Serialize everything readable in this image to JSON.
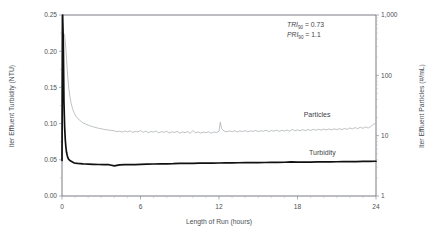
{
  "chart_data": {
    "type": "line",
    "title": "",
    "xlabel": "Length of Run  (hours)",
    "ylabel": "lter Effluent Turbidity  (NTU)",
    "y2label": "lter Effluent Particles  (#/mL)",
    "xlim": [
      0,
      24
    ],
    "ylim": [
      0.0,
      0.25
    ],
    "y2lim": [
      1,
      1000
    ],
    "y2scale": "log",
    "grid": false,
    "legend_position": "inline-annotations",
    "xticks": [
      0,
      6,
      12,
      18,
      24
    ],
    "xticklabels": [
      "0",
      "6",
      "12",
      "18",
      "24"
    ],
    "yticks": [
      0.0,
      0.05,
      0.1,
      0.15,
      0.2,
      0.25
    ],
    "yticklabels": [
      "0.00",
      "0.05",
      "0.10",
      "0.15",
      "0.20",
      "0.25"
    ],
    "y2ticks": [
      1,
      10,
      100,
      1000
    ],
    "y2ticklabels": [
      "1",
      "10",
      "100",
      "1,000"
    ],
    "annotations": [
      {
        "text_italic": "TRI",
        "subscript": "90",
        "text_rest": " = 0.73"
      },
      {
        "text_italic": "PRI",
        "subscript": "90",
        "text_rest": " = 1.1"
      }
    ],
    "series": [
      {
        "name": "Turbidity",
        "axis": "left",
        "units": "NTU",
        "color": "#111111",
        "label_x": 19.9,
        "label_y": 0.0565,
        "x": [
          0.0,
          0.05,
          0.1,
          0.15,
          0.2,
          0.25,
          0.3,
          0.35,
          0.4,
          0.45,
          0.5,
          0.6,
          0.7,
          0.8,
          0.9,
          1.0,
          1.2,
          1.4,
          1.6,
          1.8,
          2.0,
          2.4,
          2.8,
          3.2,
          3.6,
          4.0,
          4.4,
          4.8,
          5.2,
          5.6,
          6.0,
          6.5,
          7.0,
          7.5,
          8.0,
          8.5,
          9.0,
          9.5,
          10.0,
          10.5,
          11.0,
          11.5,
          12.0,
          12.5,
          13.0,
          13.5,
          14.0,
          14.5,
          15.0,
          15.5,
          16.0,
          16.5,
          17.0,
          17.5,
          18.0,
          18.5,
          19.0,
          19.5,
          20.0,
          20.5,
          21.0,
          21.5,
          22.0,
          22.5,
          23.0,
          23.5,
          24.0
        ],
        "y": [
          0.049,
          0.25,
          0.213,
          0.13,
          0.096,
          0.078,
          0.067,
          0.06,
          0.056,
          0.053,
          0.051,
          0.049,
          0.048,
          0.047,
          0.046,
          0.0455,
          0.045,
          0.0447,
          0.0444,
          0.0442,
          0.044,
          0.0437,
          0.0435,
          0.0433,
          0.0432,
          0.0415,
          0.043,
          0.0432,
          0.0433,
          0.0434,
          0.0436,
          0.044,
          0.0442,
          0.0444,
          0.0445,
          0.0447,
          0.0452,
          0.045,
          0.0452,
          0.0453,
          0.0454,
          0.0455,
          0.0456,
          0.0457,
          0.0458,
          0.0459,
          0.046,
          0.0461,
          0.0462,
          0.0463,
          0.0464,
          0.0465,
          0.0466,
          0.047,
          0.0467,
          0.0468,
          0.0469,
          0.047,
          0.0471,
          0.0472,
          0.0473,
          0.0474,
          0.0475,
          0.0476,
          0.0477,
          0.0478,
          0.048
        ]
      },
      {
        "name": "Particles",
        "axis": "right",
        "units": "#/mL",
        "color": "#a8adb2",
        "label_x": 19.5,
        "label_y_turb_equiv": 0.1085,
        "x": [
          0.0,
          0.05,
          0.1,
          0.15,
          0.2,
          0.25,
          0.3,
          0.35,
          0.4,
          0.5,
          0.6,
          0.7,
          0.8,
          0.9,
          1.0,
          1.2,
          1.4,
          1.6,
          1.8,
          2.0,
          2.2,
          2.4,
          2.6,
          2.8,
          3.0,
          3.2,
          3.4,
          3.6,
          3.8,
          4.0,
          4.2,
          4.4,
          4.6,
          4.8,
          5.0,
          5.2,
          5.4,
          5.6,
          5.8,
          6.0,
          6.2,
          6.4,
          6.6,
          6.8,
          7.0,
          7.2,
          7.4,
          7.6,
          7.8,
          8.0,
          8.2,
          8.4,
          8.6,
          8.8,
          9.0,
          9.2,
          9.4,
          9.6,
          9.8,
          10.0,
          10.2,
          10.4,
          10.6,
          10.8,
          11.0,
          11.2,
          11.4,
          11.6,
          11.8,
          12.0,
          12.1,
          12.2,
          12.4,
          12.6,
          12.8,
          13.0,
          13.2,
          13.4,
          13.6,
          13.8,
          14.0,
          14.2,
          14.4,
          14.6,
          14.8,
          15.0,
          15.2,
          15.4,
          15.6,
          15.8,
          16.0,
          16.2,
          16.4,
          16.6,
          16.8,
          17.0,
          17.2,
          17.4,
          17.6,
          17.8,
          18.0,
          18.2,
          18.4,
          18.6,
          18.8,
          19.0,
          19.2,
          19.4,
          19.6,
          19.8,
          20.0,
          20.2,
          20.4,
          20.6,
          20.8,
          21.0,
          21.2,
          21.4,
          21.6,
          21.8,
          22.0,
          22.2,
          22.4,
          22.6,
          22.8,
          23.0,
          23.2,
          23.4,
          23.6,
          23.8,
          24.0
        ],
        "y_turb_equiv": [
          0.15,
          0.195,
          0.218,
          0.224,
          0.222,
          0.214,
          0.202,
          0.188,
          0.174,
          0.152,
          0.138,
          0.128,
          0.121,
          0.116,
          0.112,
          0.107,
          0.104,
          0.101,
          0.0995,
          0.098,
          0.0965,
          0.0955,
          0.0945,
          0.0935,
          0.0928,
          0.0922,
          0.0915,
          0.091,
          0.0905,
          0.09,
          0.0888,
          0.0895,
          0.0882,
          0.0898,
          0.0885,
          0.09,
          0.0878,
          0.0892,
          0.0886,
          0.0904,
          0.088,
          0.0896,
          0.0875,
          0.089,
          0.0884,
          0.0898,
          0.0872,
          0.0888,
          0.088,
          0.0894,
          0.087,
          0.0886,
          0.0878,
          0.0892,
          0.0868,
          0.0884,
          0.0876,
          0.089,
          0.0866,
          0.0905,
          0.0872,
          0.0886,
          0.087,
          0.0882,
          0.0874,
          0.0888,
          0.0868,
          0.0884,
          0.0878,
          0.0892,
          0.102,
          0.093,
          0.0895,
          0.0886,
          0.09,
          0.0888,
          0.0902,
          0.0884,
          0.0898,
          0.089,
          0.0904,
          0.0886,
          0.09,
          0.0892,
          0.0906,
          0.0888,
          0.0902,
          0.0894,
          0.0908,
          0.089,
          0.0904,
          0.0896,
          0.091,
          0.0892,
          0.0906,
          0.0898,
          0.0912,
          0.0894,
          0.092,
          0.09,
          0.0914,
          0.0902,
          0.0916,
          0.0904,
          0.0918,
          0.0906,
          0.092,
          0.0908,
          0.0922,
          0.091,
          0.0924,
          0.0912,
          0.0926,
          0.0914,
          0.0928,
          0.0916,
          0.093,
          0.0918,
          0.0932,
          0.092,
          0.094,
          0.0926,
          0.0945,
          0.093,
          0.095,
          0.0934,
          0.0955,
          0.0938,
          0.096,
          0.099,
          0.1005
        ]
      }
    ]
  }
}
